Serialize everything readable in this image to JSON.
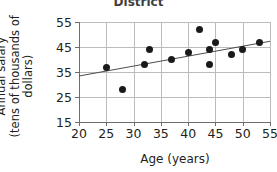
{
  "chart_data": {
    "type": "scatter",
    "title": "District",
    "xlabel": "Age (years)",
    "ylabel": "Annual salary (tens of thousands of dollars)",
    "ylabel_lines": [
      "Annual salary",
      "(tens of thousands of",
      "dollars)"
    ],
    "xlim": [
      20,
      55
    ],
    "ylim": [
      15,
      55
    ],
    "xticks": [
      20,
      25,
      30,
      35,
      40,
      45,
      50,
      55
    ],
    "yticks": [
      15,
      25,
      35,
      45,
      55
    ],
    "grid": true,
    "legend": "none",
    "point_color": "#1a1a1a",
    "grid_color": "#bcbcbc",
    "axis_color": "#6d6d6d",
    "points": [
      {
        "x": 25,
        "y": 37
      },
      {
        "x": 28,
        "y": 28
      },
      {
        "x": 32,
        "y": 38
      },
      {
        "x": 33,
        "y": 44
      },
      {
        "x": 37,
        "y": 40
      },
      {
        "x": 40,
        "y": 43
      },
      {
        "x": 42,
        "y": 52
      },
      {
        "x": 44,
        "y": 44
      },
      {
        "x": 44,
        "y": 38
      },
      {
        "x": 45,
        "y": 47
      },
      {
        "x": 48,
        "y": 42
      },
      {
        "x": 50,
        "y": 44
      },
      {
        "x": 53,
        "y": 47
      }
    ],
    "trend_line": {
      "x_start": 20,
      "y_start": 33.4,
      "x_end": 55,
      "y_end": 47.3
    }
  }
}
